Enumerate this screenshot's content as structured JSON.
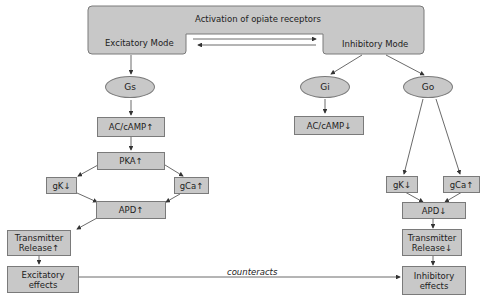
{
  "header": {
    "title": "Activation of opiate receptors",
    "left_mode": "Excitatory Mode",
    "right_mode": "Inhibitory Mode"
  },
  "excitatory": {
    "g_protein": "Gs",
    "ac": "AC/cAMP↑",
    "pka": "PKA↑",
    "gk": "gK↓",
    "gca": "gCa↑",
    "apd": "APD↑",
    "transmitter_line1": "Transmitter",
    "transmitter_line2": "Release↑",
    "effects_line1": "Excitatory",
    "effects_line2": "effects"
  },
  "inhibitory": {
    "gi": "Gi",
    "go": "Go",
    "ac": "AC/cAMP↓",
    "gk": "gK↓",
    "gca": "gCa↑",
    "apd": "APD↓",
    "transmitter_line1": "Transmitter",
    "transmitter_line2": "Release↓",
    "effects_line1": "Inhibitory",
    "effects_line2": "effects"
  },
  "connector": {
    "counteracts": "counteracts"
  },
  "colors": {
    "box_fill": "#c8c8c8",
    "box_border": "#7a7a7a",
    "line": "#444444"
  }
}
